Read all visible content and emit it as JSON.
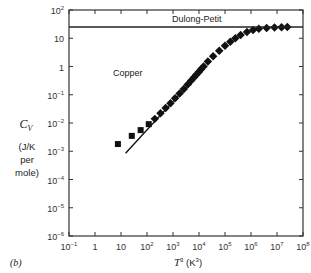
{
  "chart_data": {
    "type": "scatter",
    "panel_label": "(b)",
    "annotations": [
      "Dulong-Petit",
      "Copper"
    ],
    "xlabel": "T³ (K³)",
    "ylabel": "C_V (J/K per mole)",
    "xscale": "log",
    "yscale": "log",
    "xlim": [
      0.1,
      100000000
    ],
    "ylim": [
      1e-06,
      100
    ],
    "x_ticks": [
      "10⁻¹",
      "1",
      "10",
      "10²",
      "10³",
      "10⁴",
      "10⁵",
      "10⁶",
      "10⁷",
      "10⁸"
    ],
    "y_ticks": [
      "10⁻⁶",
      "10⁻⁵",
      "10⁻⁴",
      "10⁻³",
      "10⁻²",
      "10⁻¹",
      "1",
      "10",
      "10²"
    ],
    "grid": false,
    "series": [
      {
        "name": "Copper (measured)",
        "marker": "square",
        "x": [
          7.6,
          26,
          57,
          117,
          200,
          330,
          520,
          800,
          1200,
          1800,
          2600,
          3700,
          5000,
          6500,
          8000,
          10000,
          12000,
          15000,
          22000,
          35000,
          60000,
          100000,
          160000,
          250000,
          400000,
          700000,
          1200000,
          2000000,
          4000000,
          8000000,
          15000000,
          25000000
        ],
        "y": [
          0.0018,
          0.0035,
          0.0056,
          0.0091,
          0.014,
          0.022,
          0.034,
          0.05,
          0.075,
          0.11,
          0.16,
          0.23,
          0.32,
          0.42,
          0.52,
          0.65,
          0.8,
          1.0,
          1.5,
          2.3,
          3.6,
          5.4,
          7.5,
          10,
          13,
          16.5,
          19.5,
          21.5,
          23.2,
          24.2,
          24.7,
          24.9
        ]
      },
      {
        "name": "Debye T³ law",
        "type": "line",
        "x": [
          15,
          6000
        ],
        "y": [
          0.00085,
          0.35
        ]
      },
      {
        "name": "Dulong-Petit limit",
        "type": "hline",
        "y": 24.9
      }
    ]
  }
}
